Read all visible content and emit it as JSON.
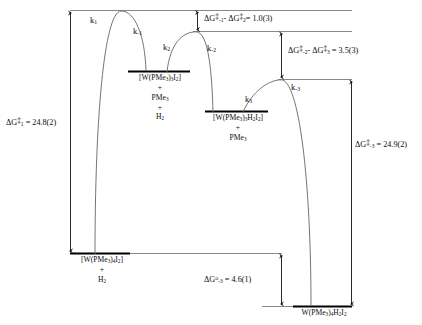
{
  "diagram": {
    "type": "energy-profile",
    "units": "kcal mol-1",
    "background_color": "#ffffff",
    "line_color": "#6e6e6e",
    "level_color": "#000000",
    "text_color": "#0d0d0d"
  },
  "rate_constants": [
    {
      "id": "k1",
      "label_html": "k<sub>1</sub>",
      "text": "k1"
    },
    {
      "id": "k-1",
      "label_html": "k<sub>-1</sub>",
      "text": "k-1"
    },
    {
      "id": "k2",
      "label_html": "k<sub>2</sub>",
      "text": "k2"
    },
    {
      "id": "k-2",
      "label_html": "k<sub>-2</sub>",
      "text": "k-2"
    },
    {
      "id": "k3",
      "label_html": "k<sub>3</sub>",
      "text": "k3"
    },
    {
      "id": "k-3",
      "label_html": "k<sub>-3</sub>",
      "text": "k-3"
    }
  ],
  "species": [
    {
      "id": "reactant",
      "lines": [
        "[W(PMe3)4I2]",
        "+",
        "H2"
      ],
      "line_html": [
        "[W(PMe<sub>3</sub>)<sub>4</sub>I<sub>2</sub>]",
        "+",
        "H<sub>2</sub>"
      ]
    },
    {
      "id": "intermediate-1",
      "lines": [
        "[W(PMe3)3I2]",
        "+",
        "PMe3",
        "+",
        "H2"
      ],
      "line_html": [
        "[W(PMe<sub>3</sub>)<sub>3</sub>I<sub>2</sub>]",
        "+",
        "PMe<sub>3</sub>",
        "+",
        "H<sub>2</sub>"
      ]
    },
    {
      "id": "intermediate-2",
      "lines": [
        "[W(PMe3)3H2I2]",
        "+",
        "PMe3"
      ],
      "line_html": [
        "[W(PMe<sub>3</sub>)<sub>3</sub>H<sub>2</sub>I<sub>2</sub>]",
        "+",
        "PMe<sub>3</sub>"
      ]
    },
    {
      "id": "product",
      "lines": [
        "W(PMe3)4H2I2"
      ],
      "line_html": [
        "W(PMe<sub>3</sub>)<sub>4</sub>H<sub>2</sub>I<sub>2</sub>"
      ]
    }
  ],
  "energies": [
    {
      "id": "dG1",
      "text": "ΔG‡ 1 = 24.8(2)",
      "html": "ΔG<sup class=\"dd\">‡</sup><sub>1</sub> = 24.8(2)",
      "value": 24.8,
      "uncertainty": 0.2,
      "kind": "activation"
    },
    {
      "id": "dGm1-dG2",
      "text": "ΔG‡ -1 - ΔG‡ 2 = 1.0(3)",
      "html": "ΔG<sup class=\"dd\">‡</sup><sub>-1</sub>- ΔG<sup class=\"dd\">‡</sup><sub>2</sub>= 1.0(3)",
      "value": 1.0,
      "uncertainty": 0.3,
      "kind": "difference"
    },
    {
      "id": "dGm2-dG3",
      "text": "ΔG‡ -2 - ΔG‡ 3 = 3.5(3)",
      "html": "ΔG<sup class=\"dd\">‡</sup><sub>-2</sub>- ΔG<sup class=\"dd\">‡</sup><sub>3</sub> = 3.5(3)",
      "value": 3.5,
      "uncertainty": 0.3,
      "kind": "difference"
    },
    {
      "id": "dGm3",
      "text": "ΔG‡ -3 = 24.9(2)",
      "html": "ΔG<sup class=\"dd\">‡</sup><sub>-3</sub> = 24.9(2)",
      "value": 24.9,
      "uncertainty": 0.2,
      "kind": "activation"
    },
    {
      "id": "dG0m3",
      "text": "ΔG° -3 = 4.6(1)",
      "html": "ΔG<sup>o</sup><sub>-3</sub> = 4.6(1)",
      "value": 4.6,
      "uncertainty": 0.1,
      "kind": "reaction"
    }
  ]
}
